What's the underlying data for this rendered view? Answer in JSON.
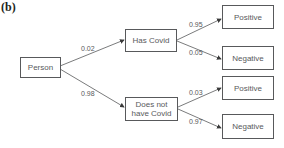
{
  "panel_label": "(b)",
  "nodes": {
    "root": "Person",
    "has_covid": "Has Covid",
    "no_covid": "Does not have Covid",
    "hc_positive": "Positive",
    "hc_negative": "Negative",
    "nc_positive": "Positive",
    "nc_negative": "Negative"
  },
  "probabilities": {
    "root_to_has_covid": "0.02",
    "root_to_no_covid": "0.98",
    "has_covid_to_positive": "0.95",
    "has_covid_to_negative": "0.05",
    "no_covid_to_positive": "0.03",
    "no_covid_to_negative": "0.97"
  },
  "colors": {
    "stroke": "#58595b",
    "text": "#58595b"
  }
}
